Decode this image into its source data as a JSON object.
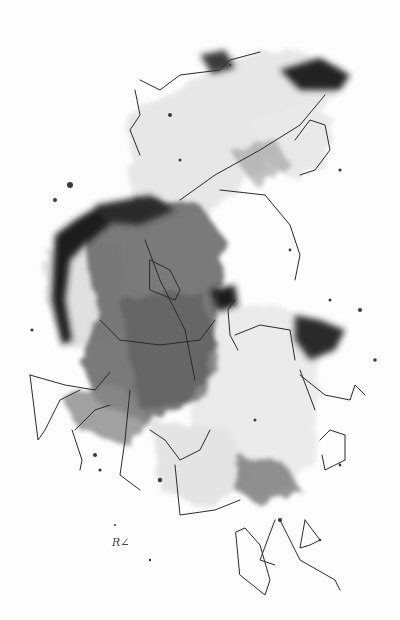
{
  "artwork": {
    "title": "Abstract ink wash with pen line drawing",
    "signature": "R∠",
    "palette": {
      "background": "#fdfdfd",
      "ink_dark": "#1e1e1e",
      "ink_mid": "#5a5a5a",
      "ink_light": "#9a9a9a",
      "wash_pale": "#d8d8d8",
      "line": "#2a2a2a"
    }
  }
}
